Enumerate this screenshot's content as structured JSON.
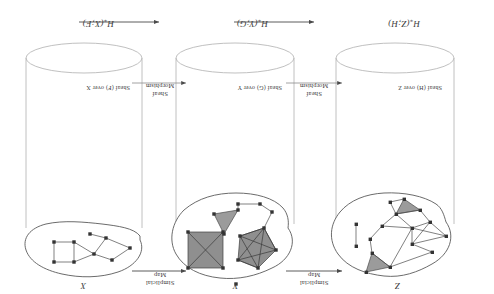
{
  "figure": {
    "orientation": "rotated-180",
    "colors": {
      "outline": "#555555",
      "vertex": "#3b3b3b",
      "edge": "#4a4a4a",
      "face_fill": "#9a9a9a",
      "cylinder": "#b8b8b8",
      "text": "#3a3a3a"
    },
    "columns": [
      {
        "id": "left",
        "space_label": "Z",
        "sheaf_label": "Sheaf (H) over Z",
        "homology_label": "H",
        "homology_sub": "*",
        "homology_arg": "(Z;H)"
      },
      {
        "id": "middle",
        "space_label": "Y",
        "sheaf_label": "Sheaf (G) over Y",
        "homology_label": "H",
        "homology_sub": "*",
        "homology_arg": "(Y;G)"
      },
      {
        "id": "right",
        "space_label": "X",
        "sheaf_label": "Sheaf (F) over X",
        "homology_label": "H",
        "homology_sub": "*",
        "homology_arg": "(X;F)"
      }
    ],
    "top_arrows": [
      {
        "id": "left-arrow",
        "line1": "Simplicial",
        "line2": "Map"
      },
      {
        "id": "right-arrow",
        "line1": "Simplicial",
        "line2": "Map"
      }
    ],
    "middle_arrows": [
      {
        "id": "left-morphism",
        "line1": "Sheaf",
        "line2": "Morphism"
      },
      {
        "id": "right-morphism",
        "line1": "Sheaf",
        "line2": "Morphism"
      }
    ],
    "bottom_arrows": [
      {
        "id": "bottom-arrow-left"
      },
      {
        "id": "bottom-arrow-right"
      }
    ]
  }
}
